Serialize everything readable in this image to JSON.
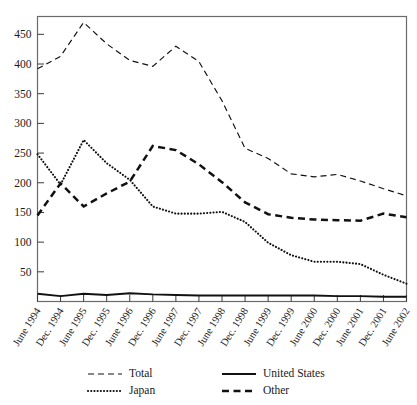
{
  "chart_data": {
    "type": "line",
    "title": "",
    "xlabel": "",
    "ylabel": "",
    "ylim": [
      0,
      480
    ],
    "yticks": [
      50,
      100,
      150,
      200,
      250,
      300,
      350,
      400,
      450
    ],
    "grid": false,
    "legend_position": "bottom",
    "categories": [
      "June 1994",
      "Dec. 1994",
      "June 1995",
      "Dec. 1995",
      "June 1996",
      "Dec. 1996",
      "June 1997",
      "Dec. 1997",
      "June 1998",
      "Dec. 1998",
      "June 1999",
      "Dec. 1999",
      "June 2000",
      "Dec. 2000",
      "June 2001",
      "Dec. 2001",
      "June 2002"
    ],
    "series": [
      {
        "name": "Total",
        "style": "dashed-thin",
        "values": [
          392,
          413,
          470,
          434,
          406,
          396,
          430,
          404,
          338,
          258,
          241,
          215,
          210,
          214,
          203,
          190,
          178
        ]
      },
      {
        "name": "Japan",
        "style": "dotted",
        "values": [
          248,
          197,
          272,
          233,
          205,
          160,
          148,
          148,
          151,
          134,
          99,
          78,
          67,
          67,
          63,
          45,
          30
        ]
      },
      {
        "name": "United States",
        "style": "solid-thick",
        "values": [
          13,
          9,
          13,
          11,
          14,
          12,
          11,
          10,
          10,
          10,
          10,
          10,
          10,
          9,
          9,
          8,
          8
        ]
      },
      {
        "name": "Other",
        "style": "dashed-thick",
        "values": [
          145,
          199,
          160,
          182,
          202,
          262,
          255,
          231,
          201,
          167,
          147,
          141,
          138,
          137,
          136,
          148,
          142
        ]
      }
    ]
  },
  "legend": {
    "entries": [
      {
        "label": "Total",
        "style": "dashed-thin"
      },
      {
        "label": "Japan",
        "style": "dotted"
      },
      {
        "label": "United States",
        "style": "solid-thick"
      },
      {
        "label": "Other",
        "style": "dashed-thick"
      }
    ]
  },
  "colors": {
    "series": "#111111",
    "axis": "#6b6b6b",
    "background": "#ffffff"
  }
}
